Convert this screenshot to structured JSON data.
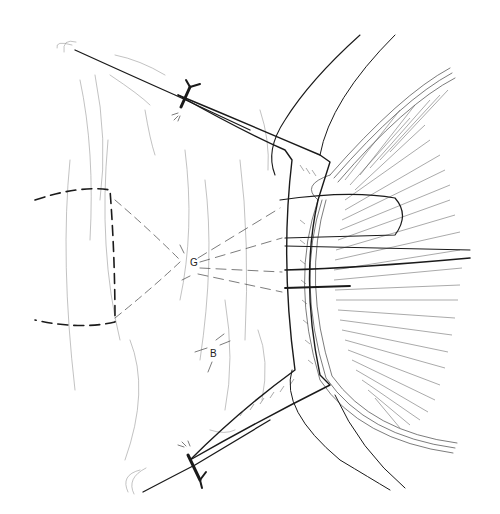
{
  "figure": {
    "kind": "surgical line illustration",
    "colors": {
      "ink": "#1a1a1a",
      "background": "#ffffff"
    },
    "labels": {
      "marker_upper": "G",
      "marker_lower": "B"
    },
    "elements": [
      "globe-limbus-with-radial-hatching",
      "muscle-flap-stippled",
      "sutures-through-flap",
      "tied-suture-knots-upper-and-lower",
      "dashed-planned-incision-lines",
      "conjunctival-fold-lines"
    ]
  }
}
